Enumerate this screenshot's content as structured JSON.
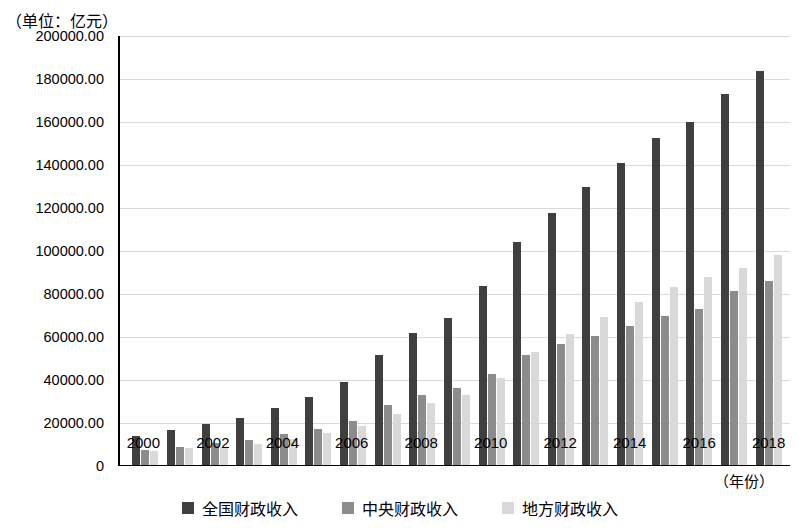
{
  "unit_caption": "（单位：亿元）",
  "x_axis_unit": "（年份）",
  "legend": [
    {
      "label": "全国财政收入",
      "color": "#3f3f3f",
      "key": "national"
    },
    {
      "label": "中央财政收入",
      "color": "#8c8c8c",
      "key": "central"
    },
    {
      "label": "地方财政收入",
      "color": "#d9d9d9",
      "key": "local"
    }
  ],
  "y_ticks": [
    "0",
    "20000.00",
    "40000.00",
    "60000.00",
    "80000.00",
    "100000.00",
    "120000.00",
    "140000.00",
    "160000.00",
    "180000.00",
    "200000.00"
  ],
  "x_ticks": [
    "2000",
    "2002",
    "2004",
    "2006",
    "2008",
    "2010",
    "2012",
    "2014",
    "2016",
    "2018"
  ],
  "chart_data": {
    "type": "bar",
    "title": "",
    "subtitle": "",
    "xlabel": "（年份）",
    "ylabel": "（单位：亿元）",
    "ylim": [
      0,
      200000
    ],
    "ytick_step": 20000,
    "grid": true,
    "legend_position": "bottom",
    "categories": [
      "2000",
      "2001",
      "2002",
      "2003",
      "2004",
      "2005",
      "2006",
      "2007",
      "2008",
      "2009",
      "2010",
      "2011",
      "2012",
      "2013",
      "2014",
      "2015",
      "2016",
      "2017",
      "2018"
    ],
    "series": [
      {
        "name": "全国财政收入",
        "color": "#3f3f3f",
        "values": [
          13395,
          16386,
          18904,
          21715,
          26396,
          31649,
          38760,
          51322,
          61330,
          68518,
          83102,
          103874,
          117254,
          129210,
          140370,
          152269,
          159605,
          172593,
          183360
        ]
      },
      {
        "name": "中央财政收入",
        "color": "#8c8c8c",
        "values": [
          6989,
          8583,
          10389,
          11865,
          14503,
          16549,
          20457,
          27749,
          32681,
          35916,
          42488,
          51327,
          56175,
          60198,
          64493,
          69267,
          72366,
          81123,
          85456
        ]
      },
      {
        "name": "地方财政收入",
        "color": "#d9d9d9",
        "values": [
          6406,
          7803,
          8515,
          9850,
          11893,
          15101,
          18304,
          23573,
          28650,
          32603,
          40613,
          52547,
          61078,
          69011,
          75877,
          83002,
          87239,
          91469,
          97905
        ]
      }
    ]
  }
}
